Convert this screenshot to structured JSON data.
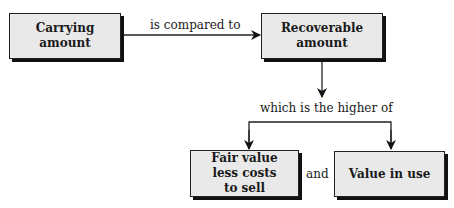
{
  "diagram": {
    "nodes": {
      "carrying_amount": "Carrying amount",
      "recoverable_amount": "Recoverable amount",
      "fair_value_less_costs": "Fair value less costs to sell",
      "value_in_use": "Value in use"
    },
    "edges": {
      "compared": "is compared to",
      "higher_of": "which is the higher of",
      "and": "and"
    },
    "colors": {
      "box_fill": "#e9e9e9",
      "line": "#1a1a1a"
    }
  }
}
